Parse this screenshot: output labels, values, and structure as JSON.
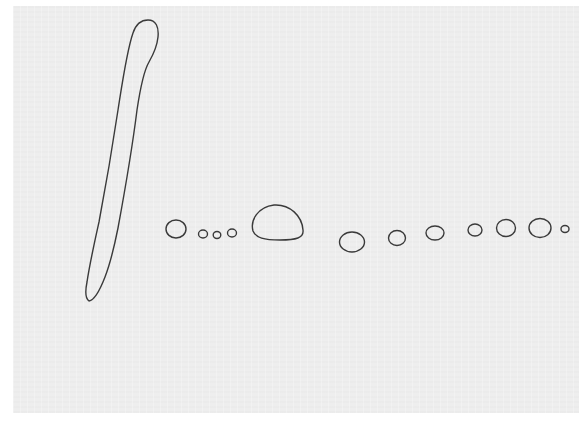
{
  "canvas": {
    "width": 586,
    "height": 425,
    "margin_color": "#ffffff",
    "paper_color": "#eeeeee",
    "stroke_color": "#3a3a3a"
  },
  "drawing": {
    "elongated_shape": {
      "description": "long tapered finger-like outline",
      "path": "M 89 301 C 86 299 85 292 87 282 C 90 262 95 240 99 222 C 106 185 112 150 118 110 C 123 78 127 50 133 33 C 136 24 141 20 148 20 C 156 20 159 27 158 37 C 157 47 153 55 149 62 C 143 72 140 90 137 110 C 132 150 125 190 118 228 C 114 248 110 264 105 277 C 100 290 95 300 89 301 Z"
    },
    "blobs": [
      {
        "name": "blob-1",
        "cx": 176,
        "cy": 229,
        "rx": 10,
        "ry": 9
      },
      {
        "name": "blob-2",
        "cx": 203,
        "cy": 234,
        "rx": 4.5,
        "ry": 4
      },
      {
        "name": "blob-3",
        "cx": 217,
        "cy": 235,
        "rx": 3.8,
        "ry": 3.5
      },
      {
        "name": "blob-4",
        "cx": 232,
        "cy": 233,
        "rx": 4.5,
        "ry": 4
      },
      {
        "name": "blob-6",
        "cx": 352,
        "cy": 242,
        "rx": 12.5,
        "ry": 10
      },
      {
        "name": "blob-7",
        "cx": 397,
        "cy": 238,
        "rx": 8.5,
        "ry": 7.5
      },
      {
        "name": "blob-8",
        "cx": 435,
        "cy": 233,
        "rx": 9,
        "ry": 7
      },
      {
        "name": "blob-9",
        "cx": 475,
        "cy": 230,
        "rx": 7,
        "ry": 6
      },
      {
        "name": "blob-10",
        "cx": 506,
        "cy": 228,
        "rx": 9.5,
        "ry": 8.5
      },
      {
        "name": "blob-11",
        "cx": 540,
        "cy": 228,
        "rx": 11,
        "ry": 9.5
      },
      {
        "name": "blob-12",
        "cx": 565,
        "cy": 229,
        "rx": 4,
        "ry": 3.5
      }
    ],
    "dome_shape": {
      "description": "large dome-shaped outline",
      "path": "M 253 231 C 250 220 258 207 274 205 C 290 204 302 216 303 230 C 304 238 296 240 280 240 C 264 240 256 238 253 231 Z"
    }
  }
}
